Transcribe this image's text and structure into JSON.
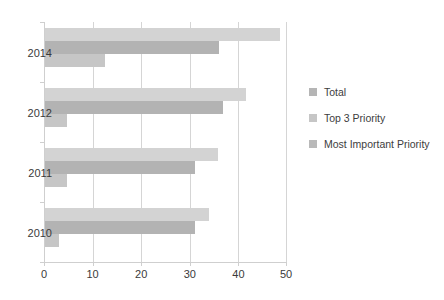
{
  "chart_data": {
    "type": "bar",
    "orientation": "horizontal",
    "title": "",
    "xlabel": "",
    "ylabel": "",
    "categories": [
      "2014",
      "2012",
      "2011",
      "2010"
    ],
    "xlim": [
      0,
      50
    ],
    "xticks": [
      0,
      10,
      20,
      30,
      40,
      50
    ],
    "grid": true,
    "legend_position": "right",
    "series": [
      {
        "name": "Total",
        "color": "#d3d3d3",
        "values": [
          48.5,
          41.5,
          35.7,
          34.0
        ]
      },
      {
        "name": "Top 3 Priority",
        "color": "#b3b3b3",
        "values": [
          36.0,
          36.8,
          31.0,
          31.0
        ]
      },
      {
        "name": "Most Important Priority",
        "color": "#c6c6c6",
        "values": [
          12.5,
          4.8,
          4.8,
          3.0
        ]
      }
    ]
  },
  "legend": {
    "items": [
      {
        "label": "Total"
      },
      {
        "label": "Top 3 Priority"
      },
      {
        "label": "Most Important Priority"
      }
    ]
  },
  "axis": {
    "x_tick_labels": [
      "0",
      "10",
      "20",
      "30",
      "40",
      "50"
    ],
    "y_tick_labels": [
      "2014",
      "2012",
      "2011",
      "2010"
    ]
  },
  "caption": {
    "text": ""
  }
}
